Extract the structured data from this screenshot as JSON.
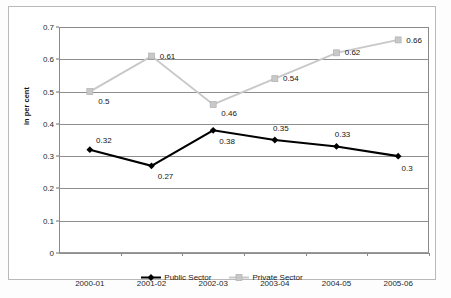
{
  "chart_data": {
    "type": "line",
    "title": "",
    "xlabel": "",
    "ylabel": "in per cent",
    "ylim": [
      0,
      0.7
    ],
    "yticks": [
      "0",
      "0.1",
      "0.2",
      "0.3",
      "0.4",
      "0.5",
      "0.6",
      "0.7"
    ],
    "ytick_values": [
      0,
      0.1,
      0.2,
      0.3,
      0.4,
      0.5,
      0.6,
      0.7
    ],
    "grid": "horizontal",
    "legend_position": "bottom-center",
    "categories": [
      "2000-01",
      "2001-02",
      "2002-03",
      "2003-04",
      "2004-05",
      "2005-06"
    ],
    "series": [
      {
        "name": "Public Sector",
        "color": "#000000",
        "marker": "diamond",
        "values": [
          0.32,
          0.27,
          0.38,
          0.35,
          0.33,
          0.3
        ],
        "labels": [
          "0.32",
          "0.27",
          "0.38",
          "0.35",
          "0.33",
          "0.3"
        ]
      },
      {
        "name": "Private Sector",
        "color": "#c8c8c8",
        "marker": "square",
        "values": [
          0.5,
          0.61,
          0.46,
          0.54,
          0.62,
          0.66
        ],
        "labels": [
          "0.5",
          "0.61",
          "0.46",
          "0.54",
          "0.62",
          "0.66"
        ]
      }
    ]
  },
  "axis": {
    "y_title": "in per cent"
  },
  "legend": {
    "items": [
      {
        "label": "Public Sector"
      },
      {
        "label": "Private Sector"
      }
    ]
  }
}
